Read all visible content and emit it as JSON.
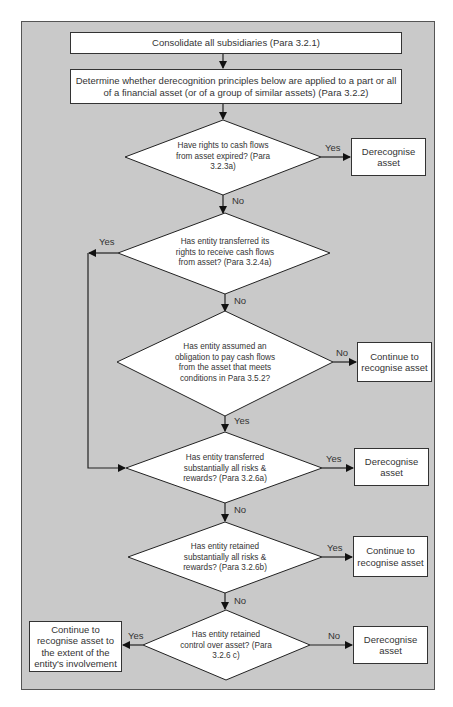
{
  "diagram": {
    "type": "flowchart",
    "title": "",
    "colors": {
      "background": "#c9c9c9",
      "node_fill": "#ffffff",
      "stroke": "#222222",
      "text": "#333333"
    },
    "steps": [
      {
        "id": "s1",
        "text": "Consolidate all subsidiaries (Para 3.2.1)"
      },
      {
        "id": "s2",
        "text": "Determine whether derecognition principles below are applied to a part or all of a financial asset (or of a group of similar assets) (Para 3.2.2)"
      }
    ],
    "decisions": [
      {
        "id": "d1",
        "text": "Have rights to cash flows from asset expired? (Para 3.2.3a)"
      },
      {
        "id": "d2",
        "text": "Has entity transferred its rights to receive cash flows from asset? (Para 3.2.4a)"
      },
      {
        "id": "d3",
        "text": "Has entity assumed an obligation to pay cash flows from the asset that meets conditions in Para 3.5.2?"
      },
      {
        "id": "d4",
        "text": "Has entity transferred substantially all risks & rewards? (Para 3.2.6a)"
      },
      {
        "id": "d5",
        "text": "Has entity retained substantially all risks & rewards? (Para 3.2.6b)"
      },
      {
        "id": "d6",
        "text": "Has entity retained control over asset? (Para 3.2.6 c)"
      }
    ],
    "outcomes": [
      {
        "id": "o1",
        "text": "Derecognise asset"
      },
      {
        "id": "o2",
        "text": "Continue to recognise asset"
      },
      {
        "id": "o3",
        "text": "Derecognise asset"
      },
      {
        "id": "o4",
        "text": "Continue to recognise asset"
      },
      {
        "id": "o5",
        "text": "Continue to recognise asset to the extent of the entity's involvement"
      },
      {
        "id": "o6",
        "text": "Derecognise asset"
      }
    ],
    "edge_labels": {
      "d1_yes": "Yes",
      "d1_no": "No",
      "d2_yes": "Yes",
      "d2_no": "No",
      "d3_no": "No",
      "d3_yes": "Yes",
      "d4_yes": "Yes",
      "d4_no": "No",
      "d5_yes": "Yes",
      "d5_no": "No",
      "d6_yes": "Yes",
      "d6_no": "No"
    },
    "edges": [
      {
        "from": "s1",
        "to": "s2",
        "label": ""
      },
      {
        "from": "s2",
        "to": "d1",
        "label": ""
      },
      {
        "from": "d1",
        "to": "o1",
        "label": "Yes"
      },
      {
        "from": "d1",
        "to": "d2",
        "label": "No"
      },
      {
        "from": "d2",
        "to": "d4",
        "label": "Yes"
      },
      {
        "from": "d2",
        "to": "d3",
        "label": "No"
      },
      {
        "from": "d3",
        "to": "o2",
        "label": "No"
      },
      {
        "from": "d3",
        "to": "d4",
        "label": "Yes"
      },
      {
        "from": "d4",
        "to": "o3",
        "label": "Yes"
      },
      {
        "from": "d4",
        "to": "d5",
        "label": "No"
      },
      {
        "from": "d5",
        "to": "o4",
        "label": "Yes"
      },
      {
        "from": "d5",
        "to": "d6",
        "label": "No"
      },
      {
        "from": "d6",
        "to": "o5",
        "label": "Yes"
      },
      {
        "from": "d6",
        "to": "o6",
        "label": "No"
      }
    ]
  }
}
